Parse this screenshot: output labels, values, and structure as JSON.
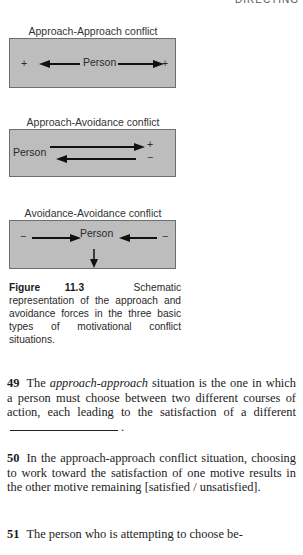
{
  "running_head": "DIRECTING",
  "figure": {
    "panels": [
      {
        "title": "Approach-Approach conflict",
        "center_label": "Person",
        "left_sign": "+",
        "right_sign": "+"
      },
      {
        "title": "Approach-Avoidance conflict",
        "left_label": "Person",
        "top_sign": "+",
        "bottom_sign": "−"
      },
      {
        "title": "Avoidance-Avoidance conflict",
        "center_label": "Person",
        "left_sign": "−",
        "right_sign": "−"
      }
    ],
    "caption_label": "Figure 11.3",
    "caption_text": "Schematic representation of the approach and avoidance forces in the three basic types of motivational conflict situations."
  },
  "items": [
    {
      "number": "49",
      "pre": "The ",
      "italic": "approach-approach",
      "post": " situation is the one in which a person must choose between two different courses of action, each leading to the satisfaction of a different",
      "end": "."
    },
    {
      "number": "50",
      "text": "In the approach-approach conflict situation, choosing to work toward the satisfaction of one motive results in the other motive remaining [satisfied / unsatisfied]."
    },
    {
      "number": "51",
      "text": "The person who is attempting to choose be-"
    }
  ]
}
